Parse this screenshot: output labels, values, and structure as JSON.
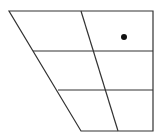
{
  "diagram": {
    "type": "ipa-vowel-chart",
    "width": 167,
    "height": 138,
    "line_color": "#333333",
    "dot_color": "#111111",
    "outline": {
      "top_left": [
        9,
        11
      ],
      "top_right": [
        153,
        11
      ],
      "bottom_right": [
        153,
        131
      ],
      "bottom_left": [
        81,
        131
      ]
    },
    "horizontal_lines": [
      {
        "y": 51,
        "x1": 33,
        "x2": 153
      },
      {
        "y": 90,
        "x1": 58,
        "x2": 153
      }
    ],
    "central_divider": {
      "x1": 81,
      "y1": 11,
      "x2": 118,
      "y2": 131
    },
    "markers": [
      {
        "label": "vowel-point",
        "cx": 124,
        "cy": 37,
        "r": 3
      }
    ]
  }
}
